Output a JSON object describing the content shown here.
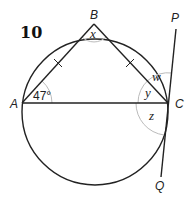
{
  "problem_number": "10",
  "points": {
    "A": {
      "label": "A",
      "x": 22,
      "y": 103
    },
    "B": {
      "label": "B",
      "x": 94,
      "y": 24
    },
    "C": {
      "label": "C",
      "x": 168,
      "y": 103
    },
    "P": {
      "label": "P",
      "x": 176,
      "y": 29
    },
    "Q": {
      "label": "Q",
      "x": 161,
      "y": 177
    }
  },
  "circle": {
    "cx": 95,
    "cy": 112,
    "r": 73
  },
  "angles": {
    "A": "47°",
    "x": "x",
    "w": "w",
    "y": "y",
    "z": "z"
  },
  "tick_marks": [
    "AB",
    "BC"
  ],
  "colors": {
    "line": "#222222",
    "arc": "#bbbbbb"
  }
}
